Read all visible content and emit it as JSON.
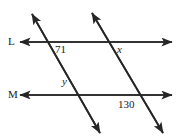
{
  "figure": {
    "stroke_color": "#262626",
    "background_color": "#ffffff",
    "lines": [
      {
        "name": "L",
        "label": "L",
        "orientation": "horizontal",
        "y": 42,
        "x_start": 20,
        "x_end": 172,
        "arrow_start": true,
        "arrow_end": true
      },
      {
        "name": "M",
        "label": "M",
        "orientation": "horizontal",
        "y": 95,
        "x_start": 20,
        "x_end": 172,
        "arrow_start": true,
        "arrow_end": true
      },
      {
        "name": "transversal-left",
        "label": "",
        "orientation": "transversal",
        "x_start": 32,
        "y_start": 14,
        "x_end": 100,
        "y_end": 133,
        "arrow_start": true,
        "arrow_end": true
      },
      {
        "name": "transversal-right",
        "label": "",
        "orientation": "transversal",
        "x_start": 92,
        "y_start": 13,
        "x_end": 163,
        "y_end": 133,
        "arrow_start": true,
        "arrow_end": true
      }
    ],
    "angle_labels": [
      {
        "id": "angle-71",
        "text": "71",
        "style": "number",
        "x": 55,
        "y": 44
      },
      {
        "id": "angle-x",
        "text": "x",
        "style": "variable",
        "x": 117,
        "y": 44
      },
      {
        "id": "angle-y",
        "text": "y",
        "style": "variable",
        "x": 62,
        "y": 76
      },
      {
        "id": "angle-130",
        "text": "130",
        "style": "number",
        "x": 118,
        "y": 99
      }
    ]
  }
}
